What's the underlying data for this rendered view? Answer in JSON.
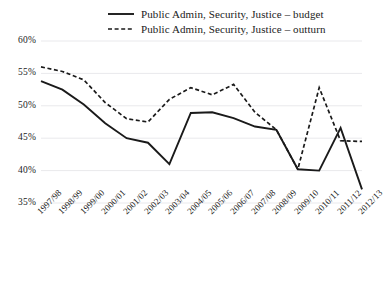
{
  "chart_data": {
    "type": "line",
    "title": "",
    "xlabel": "",
    "ylabel": "",
    "grid": true,
    "legend_position": "top",
    "ylim": [
      35,
      60
    ],
    "yticks": [
      "60%",
      "55%",
      "50%",
      "45%",
      "40%",
      "35%"
    ],
    "ytick_values": [
      60,
      55,
      50,
      45,
      40,
      35
    ],
    "categories": [
      "1997/98",
      "1998/99",
      "1999/00",
      "2000/01",
      "2001/02",
      "2002/03",
      "2003/04",
      "2004/05",
      "2005/06",
      "2006/07",
      "2007/08",
      "2008/09",
      "2009/10",
      "2010/11",
      "2011/12",
      "2012/13"
    ],
    "series": [
      {
        "name": "Public Admin, Security, Justice – budget",
        "style": "solid",
        "color": "#1a1a1a",
        "values": [
          53.8,
          52.5,
          50.2,
          47.3,
          45.0,
          44.3,
          41.0,
          48.9,
          49.0,
          48.1,
          46.8,
          46.3,
          40.2,
          40.0,
          46.6,
          37.1
        ]
      },
      {
        "name": "Public Admin, Security, Justice – outturn",
        "style": "dashed",
        "color": "#1a1a1a",
        "values": [
          56.0,
          55.3,
          54.0,
          50.5,
          48.0,
          47.5,
          51.0,
          52.8,
          51.7,
          53.3,
          49.0,
          46.3,
          40.2,
          52.8,
          44.6,
          44.5
        ]
      }
    ]
  },
  "legend": {
    "items": [
      {
        "label": "Public Admin, Security, Justice – budget",
        "style": "solid"
      },
      {
        "label": "Public Admin, Security, Justice – outturn",
        "style": "dashed"
      }
    ]
  }
}
